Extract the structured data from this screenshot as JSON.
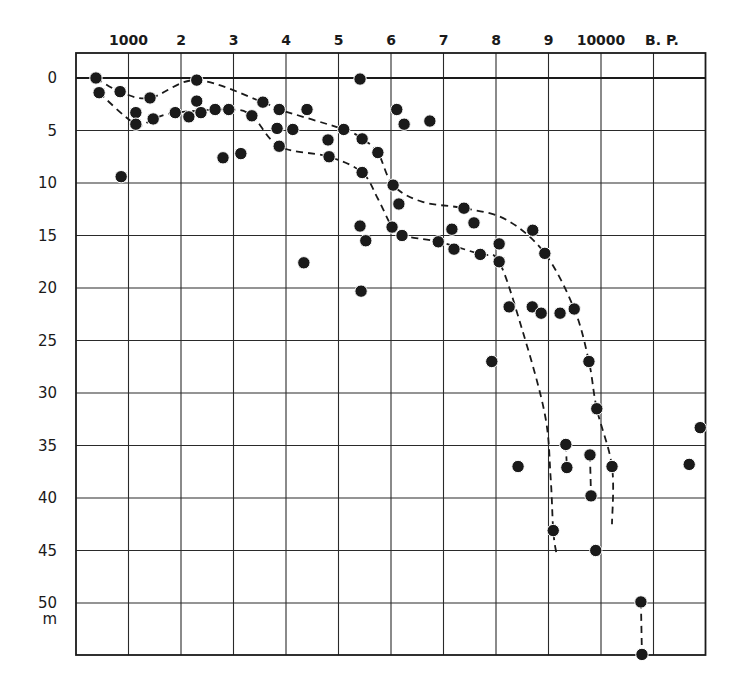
{
  "chart_data": {
    "type": "scatter",
    "title": "",
    "xlabel": "B. P.",
    "ylabel": "m",
    "x_axis": {
      "position": "top",
      "range": [
        0,
        12500
      ],
      "unit_label": "B. P.",
      "ticks": [
        {
          "value": 1000,
          "label": "1000"
        },
        {
          "value": 2000,
          "label": "2"
        },
        {
          "value": 3000,
          "label": "3"
        },
        {
          "value": 4000,
          "label": "4"
        },
        {
          "value": 5000,
          "label": "5"
        },
        {
          "value": 6000,
          "label": "6"
        },
        {
          "value": 7000,
          "label": "7"
        },
        {
          "value": 8000,
          "label": "8"
        },
        {
          "value": 9000,
          "label": "9"
        },
        {
          "value": 10000,
          "label": "10000"
        },
        {
          "value": 11000,
          "label": ""
        }
      ]
    },
    "y_axis": {
      "inverted": true,
      "range": [
        -2.4,
        55
      ],
      "unit_label": "m",
      "ticks": [
        {
          "value": 0,
          "label": "0"
        },
        {
          "value": 5,
          "label": "5"
        },
        {
          "value": 10,
          "label": "10"
        },
        {
          "value": 15,
          "label": "15"
        },
        {
          "value": 20,
          "label": "20"
        },
        {
          "value": 25,
          "label": "25"
        },
        {
          "value": 30,
          "label": "30"
        },
        {
          "value": 35,
          "label": "35"
        },
        {
          "value": 40,
          "label": "40"
        },
        {
          "value": 45,
          "label": "45"
        },
        {
          "value": 50,
          "label": "50"
        }
      ]
    },
    "grid": true,
    "legend": null,
    "points": [
      {
        "x": 380,
        "y": 0.0
      },
      {
        "x": 440,
        "y": 1.4
      },
      {
        "x": 840,
        "y": 1.3
      },
      {
        "x": 1410,
        "y": 1.9
      },
      {
        "x": 1140,
        "y": 3.3
      },
      {
        "x": 1140,
        "y": 4.4
      },
      {
        "x": 1470,
        "y": 3.9
      },
      {
        "x": 1890,
        "y": 3.3
      },
      {
        "x": 2150,
        "y": 3.7
      },
      {
        "x": 2300,
        "y": 2.2
      },
      {
        "x": 2300,
        "y": 0.2
      },
      {
        "x": 2380,
        "y": 3.3
      },
      {
        "x": 2650,
        "y": 3.0
      },
      {
        "x": 2910,
        "y": 3.0
      },
      {
        "x": 3350,
        "y": 3.6
      },
      {
        "x": 3560,
        "y": 2.3
      },
      {
        "x": 3870,
        "y": 3.0
      },
      {
        "x": 4400,
        "y": 3.0
      },
      {
        "x": 3830,
        "y": 4.8
      },
      {
        "x": 4130,
        "y": 4.9
      },
      {
        "x": 3870,
        "y": 6.5
      },
      {
        "x": 2800,
        "y": 7.6
      },
      {
        "x": 3140,
        "y": 7.2
      },
      {
        "x": 860,
        "y": 9.4
      },
      {
        "x": 5100,
        "y": 4.9
      },
      {
        "x": 4800,
        "y": 5.9
      },
      {
        "x": 5450,
        "y": 5.8
      },
      {
        "x": 4820,
        "y": 7.5
      },
      {
        "x": 5750,
        "y": 7.1
      },
      {
        "x": 5410,
        "y": 0.1
      },
      {
        "x": 6110,
        "y": 3.0
      },
      {
        "x": 6250,
        "y": 4.4
      },
      {
        "x": 6740,
        "y": 4.1
      },
      {
        "x": 5450,
        "y": 9.0
      },
      {
        "x": 6040,
        "y": 10.2
      },
      {
        "x": 6150,
        "y": 12.0
      },
      {
        "x": 5410,
        "y": 14.1
      },
      {
        "x": 5520,
        "y": 15.5
      },
      {
        "x": 6020,
        "y": 14.2
      },
      {
        "x": 6210,
        "y": 15.0
      },
      {
        "x": 4340,
        "y": 17.6
      },
      {
        "x": 5430,
        "y": 20.3
      },
      {
        "x": 7390,
        "y": 12.4
      },
      {
        "x": 7580,
        "y": 13.8
      },
      {
        "x": 7160,
        "y": 14.4
      },
      {
        "x": 6900,
        "y": 15.6
      },
      {
        "x": 7200,
        "y": 16.3
      },
      {
        "x": 7700,
        "y": 16.8
      },
      {
        "x": 8060,
        "y": 15.8
      },
      {
        "x": 8060,
        "y": 17.5
      },
      {
        "x": 8700,
        "y": 14.5
      },
      {
        "x": 8930,
        "y": 16.7
      },
      {
        "x": 8250,
        "y": 21.8
      },
      {
        "x": 8690,
        "y": 21.8
      },
      {
        "x": 8860,
        "y": 22.4
      },
      {
        "x": 9220,
        "y": 22.4
      },
      {
        "x": 9490,
        "y": 22.0
      },
      {
        "x": 7920,
        "y": 27.0
      },
      {
        "x": 9770,
        "y": 27.0
      },
      {
        "x": 9920,
        "y": 31.5
      },
      {
        "x": 9330,
        "y": 34.9
      },
      {
        "x": 9350,
        "y": 37.1
      },
      {
        "x": 8420,
        "y": 37.0
      },
      {
        "x": 9790,
        "y": 35.9
      },
      {
        "x": 9810,
        "y": 39.8
      },
      {
        "x": 10210,
        "y": 37.0
      },
      {
        "x": 9090,
        "y": 43.1
      },
      {
        "x": 9900,
        "y": 45.0
      },
      {
        "x": 11890,
        "y": 33.3
      },
      {
        "x": 11680,
        "y": 36.8
      },
      {
        "x": 10760,
        "y": 49.9
      },
      {
        "x": 10780,
        "y": 54.9
      }
    ],
    "dashed_curves": [
      {
        "name": "upper-envelope",
        "points": [
          [
            380,
            0.0
          ],
          [
            840,
            1.3
          ],
          [
            1410,
            1.9
          ],
          [
            2300,
            0.2
          ],
          [
            3560,
            2.3
          ],
          [
            3870,
            3.0
          ],
          [
            5100,
            4.9
          ],
          [
            5450,
            5.8
          ],
          [
            5750,
            7.1
          ],
          [
            6040,
            10.2
          ],
          [
            6600,
            11.8
          ],
          [
            7390,
            12.4
          ],
          [
            8200,
            13.5
          ],
          [
            8930,
            16.7
          ],
          [
            9490,
            22.0
          ],
          [
            9770,
            27.0
          ],
          [
            9920,
            31.5
          ],
          [
            10210,
            37.0
          ],
          [
            10210,
            42.5
          ]
        ]
      },
      {
        "name": "lower-envelope",
        "points": [
          [
            440,
            1.4
          ],
          [
            1140,
            4.4
          ],
          [
            1470,
            3.9
          ],
          [
            1890,
            3.3
          ],
          [
            2910,
            3.0
          ],
          [
            3350,
            3.6
          ],
          [
            3870,
            6.5
          ],
          [
            4820,
            7.5
          ],
          [
            5450,
            9.0
          ],
          [
            5750,
            11.5
          ],
          [
            6020,
            14.2
          ],
          [
            6210,
            15.0
          ],
          [
            6900,
            15.6
          ],
          [
            7700,
            16.8
          ],
          [
            8060,
            17.5
          ],
          [
            8500,
            24.0
          ],
          [
            8930,
            32.0
          ],
          [
            9040,
            38.0
          ],
          [
            9090,
            43.1
          ],
          [
            9150,
            45.3
          ]
        ]
      },
      {
        "name": "connector-1",
        "points": [
          [
            9330,
            34.9
          ],
          [
            9350,
            37.1
          ]
        ]
      },
      {
        "name": "connector-2",
        "points": [
          [
            9790,
            35.9
          ],
          [
            9810,
            39.8
          ]
        ]
      },
      {
        "name": "connector-3",
        "points": [
          [
            10760,
            49.9
          ],
          [
            10780,
            54.9
          ]
        ]
      }
    ]
  }
}
